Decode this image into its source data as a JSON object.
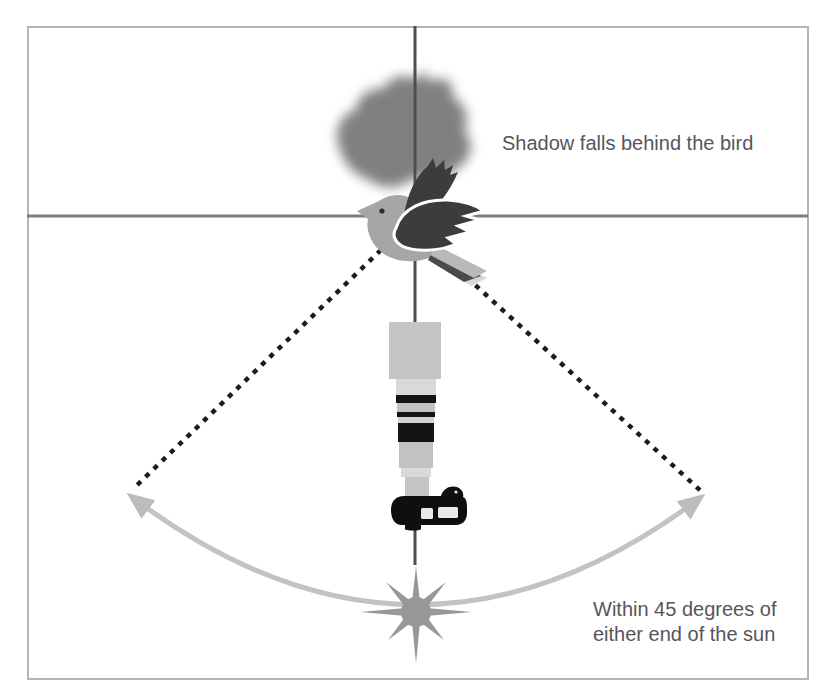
{
  "diagram": {
    "labels": {
      "shadow": "Shadow falls behind the bird",
      "sun_angle_line1": "Within 45 degrees of",
      "sun_angle_line2": "either end of the sun"
    },
    "icons": [
      "bird-icon",
      "bird-shadow-icon",
      "telephoto-lens-icon",
      "camera-body-icon",
      "sun-icon",
      "arc-double-arrow-icon",
      "sightline-dotted-left",
      "sightline-dotted-right",
      "crosshair-vertical-line",
      "crosshair-horizontal-line"
    ],
    "colors": {
      "frame_border": "#b4b4b4",
      "line_vertical": "#4e4e4e",
      "line_horizontal": "#7e7e7e",
      "text": "#55565b",
      "bird_body": "#a6a6a6",
      "bird_wing": "#3c3c3c",
      "bird_tail_light": "#b9b9b9",
      "bird_tail_dark": "#4a4a4a",
      "shadow": "#6e6e6e",
      "dotted": "#1c1c1c",
      "arc": "#c3c3c3",
      "sun": "#989898",
      "lens_gray": "#c5c5c5",
      "lens_light": "#d9d9d9",
      "lens_dark": "#141414",
      "camera": "#0f0f0f",
      "camera_screen": "#e9e9e9"
    }
  }
}
